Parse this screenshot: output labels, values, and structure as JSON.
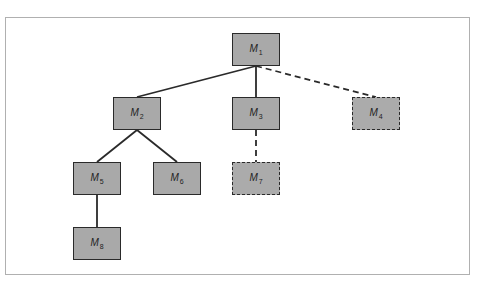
{
  "diagram": {
    "type": "tree",
    "nodes": [
      {
        "id": "M1",
        "base": "M",
        "sub": "1",
        "style": "solid",
        "x": 232,
        "y": 33
      },
      {
        "id": "M2",
        "base": "M",
        "sub": "2",
        "style": "solid",
        "x": 113,
        "y": 97
      },
      {
        "id": "M3",
        "base": "M",
        "sub": "3",
        "style": "solid",
        "x": 232,
        "y": 97
      },
      {
        "id": "M4",
        "base": "M",
        "sub": "4",
        "style": "dashed",
        "x": 352,
        "y": 97
      },
      {
        "id": "M5",
        "base": "M",
        "sub": "5",
        "style": "solid",
        "x": 73,
        "y": 162
      },
      {
        "id": "M6",
        "base": "M",
        "sub": "6",
        "style": "solid",
        "x": 153,
        "y": 162
      },
      {
        "id": "M7",
        "base": "M",
        "sub": "7",
        "style": "dashed",
        "x": 232,
        "y": 162
      },
      {
        "id": "M8",
        "base": "M",
        "sub": "8",
        "style": "solid",
        "x": 73,
        "y": 227
      }
    ],
    "edges": [
      {
        "from": "M1",
        "to": "M2",
        "style": "solid"
      },
      {
        "from": "M1",
        "to": "M3",
        "style": "solid"
      },
      {
        "from": "M1",
        "to": "M4",
        "style": "dashed"
      },
      {
        "from": "M2",
        "to": "M5",
        "style": "solid"
      },
      {
        "from": "M2",
        "to": "M6",
        "style": "solid"
      },
      {
        "from": "M3",
        "to": "M7",
        "style": "dashed"
      },
      {
        "from": "M5",
        "to": "M8",
        "style": "solid"
      }
    ],
    "colors": {
      "node_fill": "#a9a9a9",
      "node_border": "#2a2a2a",
      "edge": "#2a2a2a",
      "frame_border": "#b0b0b0"
    }
  }
}
